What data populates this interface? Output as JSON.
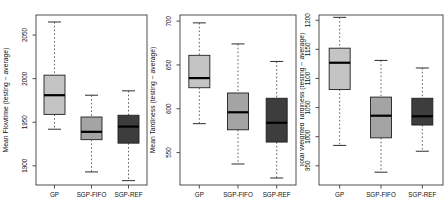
{
  "figure": {
    "background": "#ffffff",
    "frame_color": "#3c3c3c",
    "text_color": "#111111",
    "median_color": "#000000",
    "box_colors": {
      "GP": "#c4c4c4",
      "SGP-FIFO": "#a4a4a4",
      "SGP-REF": "#3d3d3d"
    }
  },
  "chart_data": [
    {
      "type": "box",
      "title": "",
      "xlabel": "",
      "ylabel": "Mean Flowtime (testing − average)",
      "categories": [
        "GP",
        "SGP-FIFO",
        "SGP-REF"
      ],
      "ylim": [
        1878,
        2073
      ],
      "yticks": [
        1900,
        1950,
        2000,
        2050
      ],
      "grid": false,
      "series": [
        {
          "name": "GP",
          "low": 1942,
          "q1": 1959,
          "median": 1981,
          "q3": 2004,
          "high": 2065,
          "color": "#c4c4c4"
        },
        {
          "name": "SGP-FIFO",
          "low": 1893,
          "q1": 1930,
          "median": 1939,
          "q3": 1956,
          "high": 1981,
          "color": "#a4a4a4"
        },
        {
          "name": "SGP-REF",
          "low": 1883,
          "q1": 1926,
          "median": 1945,
          "q3": 1958,
          "high": 1986,
          "color": "#3d3d3d"
        }
      ]
    },
    {
      "type": "box",
      "title": "",
      "xlabel": "",
      "ylabel": "Mean Tardiness (testing − average)",
      "categories": [
        "GP",
        "SGP-FIFO",
        "SGP-REF"
      ],
      "ylim": [
        513,
        707
      ],
      "yticks": [
        550,
        600,
        650,
        700
      ],
      "grid": false,
      "series": [
        {
          "name": "GP",
          "low": 583,
          "q1": 624,
          "median": 635,
          "q3": 661,
          "high": 698,
          "color": "#c4c4c4"
        },
        {
          "name": "SGP-FIFO",
          "low": 537,
          "q1": 576,
          "median": 596,
          "q3": 618,
          "high": 674,
          "color": "#a4a4a4"
        },
        {
          "name": "SGP-REF",
          "low": 521,
          "q1": 562,
          "median": 584,
          "q3": 612,
          "high": 654,
          "color": "#3d3d3d"
        }
      ]
    },
    {
      "type": "box",
      "title": "",
      "xlabel": "",
      "ylabel": "Total Weighted Tardiness (testing − average)",
      "categories": [
        "GP",
        "SGP-FIFO",
        "SGP-REF"
      ],
      "ylim": [
        917,
        1209
      ],
      "yticks": [
        950,
        1000,
        1050,
        1100,
        1150,
        1200
      ],
      "grid": false,
      "series": [
        {
          "name": "GP",
          "low": 985,
          "q1": 1081,
          "median": 1127,
          "q3": 1152,
          "high": 1205,
          "color": "#c4c4c4"
        },
        {
          "name": "SGP-FIFO",
          "low": 939,
          "q1": 998,
          "median": 1036,
          "q3": 1068,
          "high": 1131,
          "color": "#a4a4a4"
        },
        {
          "name": "SGP-REF",
          "low": 975,
          "q1": 1020,
          "median": 1035,
          "q3": 1066,
          "high": 1118,
          "color": "#3d3d3d"
        }
      ]
    }
  ]
}
